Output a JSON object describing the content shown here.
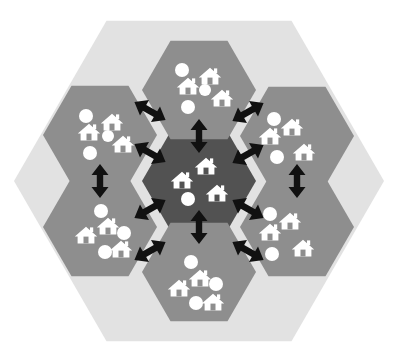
{
  "figure": {
    "name": "hexagonal-cluster-network-diagram",
    "type": "diagram",
    "canvas": {
      "width": 399,
      "height": 363,
      "background": "#ffffff"
    }
  },
  "colors": {
    "page_background": "#ffffff",
    "outer_hexagon_fill": "#e2e2e2",
    "peripheral_hexagon_fill": "#8e8e8e",
    "central_hexagon_fill": "#525252",
    "icon_fill": "#ffffff",
    "arrow_fill": "#111111",
    "house_door": "#8e8e8e",
    "house_door_center": "#525252"
  },
  "outer_hexagon": {
    "label": "region-boundary",
    "orientation": "flat-top",
    "center": {
      "x": 199,
      "y": 181
    },
    "radius": 185,
    "fill": "#e2e2e2"
  },
  "cells": [
    {
      "id": "center",
      "label": "central-hub-cell",
      "role": "hub",
      "fill": "#525252",
      "center": {
        "x": 199,
        "y": 181
      },
      "radius": 57,
      "houses": 3,
      "dots": 1,
      "house_positions": [
        {
          "x": 182,
          "y": 180
        },
        {
          "x": 206,
          "y": 166
        },
        {
          "x": 217,
          "y": 193
        }
      ],
      "dot_positions": [
        {
          "x": 188,
          "y": 199,
          "r": 7
        }
      ]
    },
    {
      "id": "top",
      "label": "north-cell",
      "role": "neighbour",
      "fill": "#8e8e8e",
      "center": {
        "x": 199,
        "y": 90
      },
      "radius": 57,
      "houses": 3,
      "dots": 3,
      "house_positions": [
        {
          "x": 188,
          "y": 86
        },
        {
          "x": 210,
          "y": 76
        },
        {
          "x": 222,
          "y": 98
        }
      ],
      "dot_positions": [
        {
          "x": 182,
          "y": 70,
          "r": 7
        },
        {
          "x": 205,
          "y": 90,
          "r": 6
        },
        {
          "x": 188,
          "y": 107,
          "r": 7
        }
      ]
    },
    {
      "id": "upper-left",
      "label": "north-west-cell",
      "role": "neighbour",
      "fill": "#8e8e8e",
      "center": {
        "x": 100,
        "y": 135
      },
      "radius": 57,
      "houses": 3,
      "dots": 3,
      "house_positions": [
        {
          "x": 89,
          "y": 132
        },
        {
          "x": 112,
          "y": 122
        },
        {
          "x": 123,
          "y": 144
        }
      ],
      "dot_positions": [
        {
          "x": 86,
          "y": 116,
          "r": 7
        },
        {
          "x": 108,
          "y": 136,
          "r": 6
        },
        {
          "x": 90,
          "y": 153,
          "r": 7
        }
      ]
    },
    {
      "id": "upper-right",
      "label": "north-east-cell",
      "role": "neighbour",
      "fill": "#8e8e8e",
      "center": {
        "x": 297,
        "y": 136
      },
      "radius": 57,
      "houses": 3,
      "dots": 2,
      "house_positions": [
        {
          "x": 270,
          "y": 136
        },
        {
          "x": 292,
          "y": 127
        },
        {
          "x": 304,
          "y": 152
        }
      ],
      "dot_positions": [
        {
          "x": 274,
          "y": 119,
          "r": 7
        },
        {
          "x": 277,
          "y": 157,
          "r": 7
        }
      ]
    },
    {
      "id": "lower-left",
      "label": "south-west-cell",
      "role": "neighbour",
      "fill": "#8e8e8e",
      "center": {
        "x": 100,
        "y": 227
      },
      "radius": 57,
      "houses": 3,
      "dots": 3,
      "house_positions": [
        {
          "x": 86,
          "y": 235
        },
        {
          "x": 108,
          "y": 226
        },
        {
          "x": 121,
          "y": 249
        }
      ],
      "dot_positions": [
        {
          "x": 101,
          "y": 211,
          "r": 7
        },
        {
          "x": 124,
          "y": 233,
          "r": 7
        },
        {
          "x": 105,
          "y": 252,
          "r": 7
        }
      ]
    },
    {
      "id": "lower-right",
      "label": "south-east-cell",
      "role": "neighbour",
      "fill": "#8e8e8e",
      "center": {
        "x": 297,
        "y": 227
      },
      "radius": 57,
      "houses": 3,
      "dots": 2,
      "house_positions": [
        {
          "x": 270,
          "y": 232
        },
        {
          "x": 290,
          "y": 221
        },
        {
          "x": 303,
          "y": 248
        }
      ],
      "dot_positions": [
        {
          "x": 270,
          "y": 214,
          "r": 7
        },
        {
          "x": 272,
          "y": 254,
          "r": 7
        }
      ]
    },
    {
      "id": "bottom",
      "label": "south-cell",
      "role": "neighbour",
      "fill": "#8e8e8e",
      "center": {
        "x": 199,
        "y": 272
      },
      "radius": 57,
      "houses": 3,
      "dots": 3,
      "house_positions": [
        {
          "x": 179,
          "y": 288
        },
        {
          "x": 200,
          "y": 278
        },
        {
          "x": 213,
          "y": 302
        }
      ],
      "dot_positions": [
        {
          "x": 191,
          "y": 262,
          "r": 7
        },
        {
          "x": 216,
          "y": 284,
          "r": 7
        },
        {
          "x": 196,
          "y": 303,
          "r": 7
        }
      ]
    }
  ],
  "connectors": [
    {
      "id": "hub-north",
      "label": "link-hub-to-north-cell",
      "from": "center",
      "to": "top",
      "style": "double-headed-arrow",
      "angle": -90,
      "cx": 199,
      "cy": 136,
      "length": 34
    },
    {
      "id": "hub-south",
      "label": "link-hub-to-south-cell",
      "from": "center",
      "to": "bottom",
      "style": "double-headed-arrow",
      "angle": 90,
      "cx": 199,
      "cy": 227,
      "length": 34
    },
    {
      "id": "hub-northwest",
      "label": "link-hub-to-north-west-cell",
      "from": "center",
      "to": "upper-left",
      "style": "double-headed-arrow",
      "angle": -150,
      "cx": 150,
      "cy": 153,
      "length": 36
    },
    {
      "id": "hub-northeast",
      "label": "link-hub-to-north-east-cell",
      "from": "center",
      "to": "upper-right",
      "style": "double-headed-arrow",
      "angle": -30,
      "cx": 248,
      "cy": 154,
      "length": 36
    },
    {
      "id": "hub-southwest",
      "label": "link-hub-to-south-west-cell",
      "from": "center",
      "to": "lower-left",
      "style": "double-headed-arrow",
      "angle": 150,
      "cx": 150,
      "cy": 209,
      "length": 36
    },
    {
      "id": "hub-southeast",
      "label": "link-hub-to-south-east-cell",
      "from": "center",
      "to": "lower-right",
      "style": "double-headed-arrow",
      "angle": 30,
      "cx": 248,
      "cy": 209,
      "length": 36
    },
    {
      "id": "north-northwest",
      "label": "link-north-to-north-west-cell",
      "from": "top",
      "to": "upper-left",
      "style": "double-headed-arrow",
      "angle": -150,
      "cx": 150,
      "cy": 111,
      "length": 36
    },
    {
      "id": "north-northeast",
      "label": "link-north-to-north-east-cell",
      "from": "top",
      "to": "upper-right",
      "style": "double-headed-arrow",
      "angle": -30,
      "cx": 248,
      "cy": 112,
      "length": 36
    },
    {
      "id": "west-link",
      "label": "link-north-west-to-south-west-cell",
      "from": "upper-left",
      "to": "lower-left",
      "style": "double-headed-arrow",
      "angle": 90,
      "cx": 100,
      "cy": 181,
      "length": 34
    },
    {
      "id": "east-link",
      "label": "link-north-east-to-south-east-cell",
      "from": "upper-right",
      "to": "lower-right",
      "style": "double-headed-arrow",
      "angle": 90,
      "cx": 297,
      "cy": 181,
      "length": 34
    },
    {
      "id": "south-southwest",
      "label": "link-south-to-south-west-cell",
      "from": "bottom",
      "to": "lower-left",
      "style": "double-headed-arrow",
      "angle": 150,
      "cx": 150,
      "cy": 251,
      "length": 36
    },
    {
      "id": "south-southeast",
      "label": "link-south-to-south-east-cell",
      "from": "bottom",
      "to": "lower-right",
      "style": "double-headed-arrow",
      "angle": 30,
      "cx": 248,
      "cy": 251,
      "length": 36
    }
  ],
  "legend_icons": {
    "house": "house-icon",
    "dot": "person-dot-icon",
    "arrow": "double-headed-arrow-icon"
  },
  "totals": {
    "cells": 7,
    "peripheral_cells": 6,
    "hub_cells": 1,
    "connectors": 12,
    "houses": 21,
    "dots": 17
  }
}
